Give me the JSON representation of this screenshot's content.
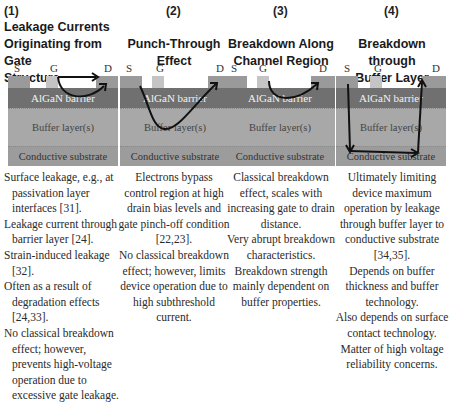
{
  "columns": [
    {
      "number": "(1)",
      "title_lines": [
        "Leakage Currents",
        "Originating from Gate",
        "Structure"
      ],
      "diagram": {
        "labels": {
          "source": "S",
          "gate": "G",
          "drain": "D"
        },
        "barrier": "AlGaN barrier",
        "buffer": "Buffer layer(s)",
        "substrate": "Conductive substrate",
        "path": "gate-to-drain through barrier"
      },
      "description": [
        "Surface leakage, e.g., at passivation layer interfaces [31].",
        "Leakage current through barrier layer [24].",
        "Strain-induced leakage [32].",
        "Often as a result of degradation effects [24,33].",
        "No classical breakdown effect; however, prevents high-voltage operation due to excessive gate leakage."
      ]
    },
    {
      "number": "(2)",
      "title_lines": [
        "Punch-Through",
        "Effect"
      ],
      "diagram": {
        "labels": {
          "source": "S",
          "gate": "G",
          "drain": "D"
        },
        "barrier": "AlGaN barrier",
        "buffer": "Buffer layer(s)",
        "substrate": "Conductive substrate",
        "path": "source-to-drain dipping into buffer"
      },
      "description": [
        "Electrons bypass control region at high drain bias levels and gate pinch-off condition [22,23].",
        "No classical breakdown effect; however, limits device operation due to high subthreshold current."
      ]
    },
    {
      "number": "(3)",
      "title_lines": [
        "Breakdown Along",
        "Channel Region"
      ],
      "diagram": {
        "labels": {
          "source": "S",
          "gate": "G",
          "drain": "D"
        },
        "barrier": "AlGaN barrier",
        "buffer": "Buffer layer(s)",
        "substrate": "Conductive substrate",
        "path": "gate-to-drain along channel"
      },
      "description": [
        "Classical breakdown effect, scales with increasing gate to drain distance.",
        "Very abrupt breakdown characteristics.",
        "Breakdown strength mainly dependent on buffer properties."
      ]
    },
    {
      "number": "(4)",
      "title_lines": [
        "Breakdown through",
        "Buffer Layer"
      ],
      "diagram": {
        "labels": {
          "source": "S",
          "gate": "G",
          "drain": "D"
        },
        "barrier": "AlGaN barrier",
        "buffer": "Buffer layer(s)",
        "substrate": "Conductive substrate",
        "path": "source down to substrate, across, up to drain"
      },
      "description": [
        "Ultimately limiting device maximum operation by leakage through buffer layer to conductive substrate [34,35].",
        "Depends on buffer thickness and buffer technology.",
        "Also depends on surface contact technology.",
        "Matter of high voltage reliability concerns."
      ]
    }
  ],
  "colors": {
    "barrier": "#707070",
    "buffer": "#a8a8a8",
    "substrate": "#9c9c9c",
    "contact": "#9a9a9a",
    "gate": "#c4c4c4",
    "arrow": "#111111"
  }
}
